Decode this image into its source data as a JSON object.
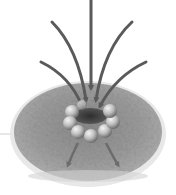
{
  "figure": {
    "kind": "illustration",
    "colors": {
      "background": "#ffffff",
      "disc_fill": "#9a9a9a",
      "disc_rim": "#e6e6e6",
      "arrow": "#5a5a5a",
      "sphere": "#c8c8c8",
      "ring_core": "#3a3a3a"
    },
    "incoming_arrows": 5,
    "outgoing_arrows": 2,
    "spheres": 8
  }
}
